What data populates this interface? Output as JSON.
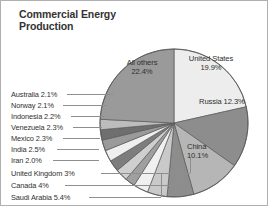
{
  "chart_title": "Commercial Energy\nProduction",
  "colors": {
    "background": "#ffffff",
    "frame": "#b0b0b0",
    "text": "#2f2f2f",
    "leader_line": "#8e8e8e",
    "slice_stroke": "#5a5a5a"
  },
  "chart_data": {
    "type": "pie",
    "title": "Commercial Energy Production",
    "subtitle": "",
    "xlabel": "",
    "ylabel": "",
    "units": "percent of world total",
    "legend_position": "callout-labels",
    "grid": false,
    "total": 100,
    "categories": [
      "United States",
      "Russia",
      "China",
      "Saudi Arabia",
      "Canada",
      "United Kingdom",
      "Iran",
      "India",
      "Mexico",
      "Venezuela",
      "Indonesia",
      "Norway",
      "Australia",
      "All others"
    ],
    "values": [
      19.9,
      12.3,
      10.1,
      5.4,
      4,
      3,
      2.0,
      2.5,
      2.3,
      2.3,
      2.2,
      2.1,
      2.1,
      22.4
    ],
    "slices": [
      {
        "name": "United States",
        "value": 19.9,
        "label": "United States\n19.9%",
        "fill": "#ededed",
        "label_kind": "inside"
      },
      {
        "name": "Russia",
        "value": 12.3,
        "label": "Russia 12.3%",
        "fill": "#8d8d8d",
        "label_kind": "inside"
      },
      {
        "name": "China",
        "value": 10.1,
        "label": "China\n10.1%",
        "fill": "#b6b6b6",
        "label_kind": "inside"
      },
      {
        "name": "Saudi Arabia",
        "value": 5.4,
        "label": "Saudi Arabia 5.4%",
        "fill": "#8d8d8d",
        "label_kind": "callout"
      },
      {
        "name": "Canada",
        "value": 4,
        "label": "Canada 4%",
        "fill": "#c9c9c9",
        "label_kind": "callout"
      },
      {
        "name": "United Kingdom",
        "value": 3,
        "label": "United Kingdom 3%",
        "fill": "#f0f0f0",
        "label_kind": "callout"
      },
      {
        "name": "Iran",
        "value": 2.0,
        "label": "Iran 2.0%",
        "fill": "#9f9f9f",
        "label_kind": "callout"
      },
      {
        "name": "India",
        "value": 2.5,
        "label": "India 2.5%",
        "fill": "#cfcfcf",
        "label_kind": "callout"
      },
      {
        "name": "Mexico",
        "value": 2.3,
        "label": "Mexico 2.3%",
        "fill": "#7d7d7d",
        "label_kind": "callout"
      },
      {
        "name": "Venezuela",
        "value": 2.3,
        "label": "Venezuela 2.3%",
        "fill": "#efefef",
        "label_kind": "callout"
      },
      {
        "name": "Indonesia",
        "value": 2.2,
        "label": "Indonesia 2.2%",
        "fill": "#9a9a9a",
        "label_kind": "callout"
      },
      {
        "name": "Norway",
        "value": 2.1,
        "label": "Norway 2.1%",
        "fill": "#6f6f6f",
        "label_kind": "callout"
      },
      {
        "name": "Australia",
        "value": 2.1,
        "label": "Australia 2.1%",
        "fill": "#bdbdbd",
        "label_kind": "callout"
      },
      {
        "name": "All others",
        "value": 22.4,
        "label": "All others\n22.4%",
        "fill": "#9a9a9a",
        "label_kind": "inside"
      }
    ]
  },
  "inside_labels": {
    "united_states": "United States\n19.9%",
    "russia": "Russia 12.3%",
    "china": "China\n10.1%",
    "all_others": "All others\n22.4%"
  },
  "callout_labels": [
    {
      "text": "Australia 2.1%"
    },
    {
      "text": "Norway 2.1%"
    },
    {
      "text": "Indonesia 2.2%"
    },
    {
      "text": "Venezuela 2.3%"
    },
    {
      "text": "Mexico 2.3%"
    },
    {
      "text": "India 2.5%"
    },
    {
      "text": "Iran 2.0%"
    },
    {
      "text": "United Kingdom 3%"
    },
    {
      "text": "Canada 4%"
    },
    {
      "text": "Saudi Arabia 5.4%"
    }
  ]
}
